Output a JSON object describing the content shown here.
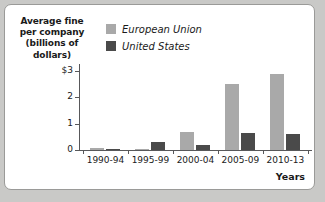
{
  "chart_data": {
    "type": "bar",
    "title": "",
    "subtitle": "",
    "ylabel_lines": [
      "Average fine",
      "per company",
      "(billions of",
      "dollars)"
    ],
    "ylabel": "Average fine per company (billions of dollars)",
    "xlabel": "Years",
    "categories": [
      "1990-94",
      "1995-99",
      "2000-04",
      "2005-09",
      "2010-13"
    ],
    "series": [
      {
        "name": "European Union",
        "color": "#a9a9a9",
        "values": [
          0.07,
          0.05,
          0.68,
          2.5,
          2.85
        ]
      },
      {
        "name": "United States",
        "color": "#4a4a4a",
        "values": [
          0.02,
          0.3,
          0.17,
          0.65,
          0.6
        ]
      }
    ],
    "ylim": [
      0,
      3.2
    ],
    "yticks": [
      0,
      1,
      2,
      3
    ],
    "ytick_labels": [
      "0",
      "1",
      "2",
      "$3"
    ],
    "grid": false,
    "legend_position": "top-center"
  },
  "legend": {
    "items": [
      {
        "label": "European Union",
        "color": "#a9a9a9"
      },
      {
        "label": "United States",
        "color": "#4a4a4a"
      }
    ]
  },
  "colors": {
    "european_union": "#a9a9a9",
    "united_states": "#4a4a4a",
    "axis": "#58585a",
    "panel_background": "#ffffff",
    "page_background": "#c9c9c7"
  }
}
